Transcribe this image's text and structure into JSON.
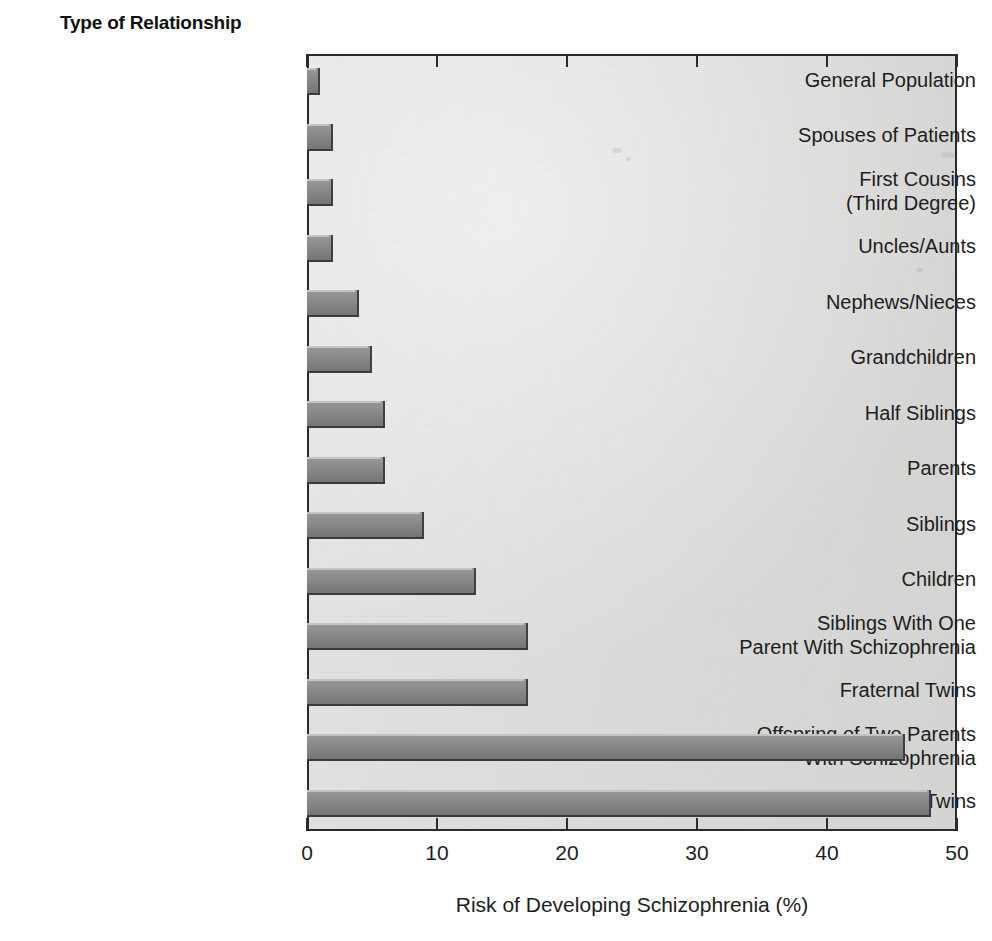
{
  "chart_data": {
    "type": "bar",
    "orientation": "horizontal",
    "title": "Type of Relationship",
    "xlabel": "Risk of Developing Schizophrenia (%)",
    "ylabel": "Type of Relationship",
    "xlim": [
      0,
      50
    ],
    "xticks": [
      0,
      10,
      20,
      30,
      40,
      50
    ],
    "xtick_labels": [
      "0",
      "10",
      "20",
      "30",
      "40",
      "50"
    ],
    "grid": false,
    "legend": null,
    "categories": [
      "General Population",
      "Spouses of Patients",
      "First Cousins\n(Third Degree)",
      "Uncles/Aunts",
      "Nephews/Nieces",
      "Grandchildren",
      "Half Siblings",
      "Parents",
      "Siblings",
      "Children",
      "Siblings With One\nParent With Schizophrenia",
      "Fraternal Twins",
      "Offspring of Two Parents\nWith Schizophrenia",
      "Identical Twins"
    ],
    "values": [
      1,
      2,
      2,
      2,
      4,
      5,
      6,
      6,
      9,
      13,
      17,
      17,
      46,
      48
    ],
    "bar_color": "#8c8c8c",
    "plot_background": "#e2e2e0",
    "axis_color": "#2b2b2b"
  },
  "axis": {
    "x_title": "Risk of Developing Schizophrenia (%)",
    "tick_labels": [
      "0",
      "10",
      "20",
      "30",
      "40",
      "50"
    ]
  },
  "header": {
    "title": "Type of Relationship"
  }
}
